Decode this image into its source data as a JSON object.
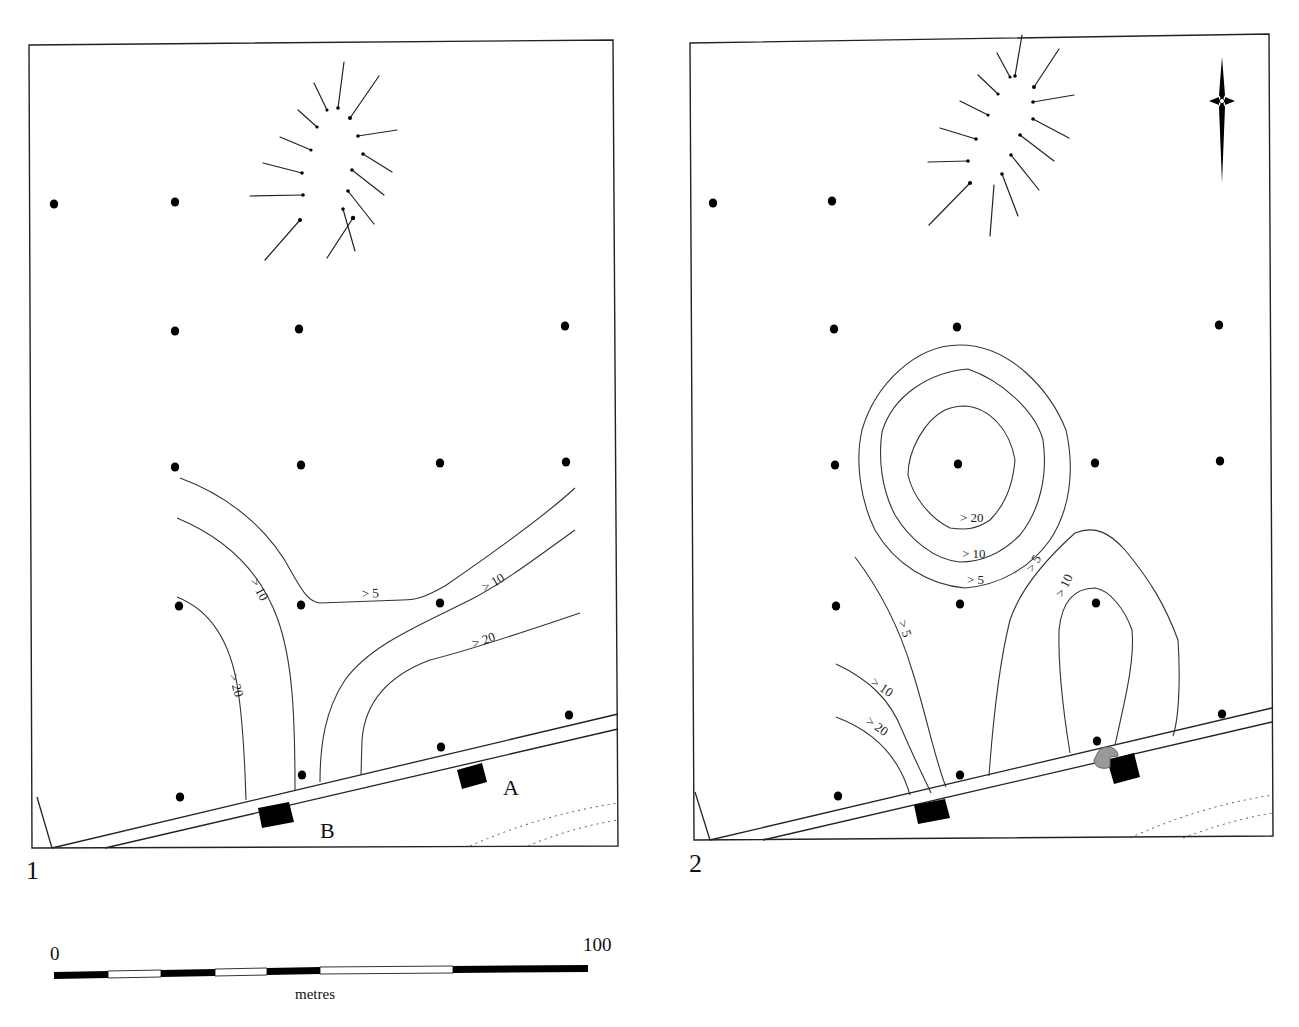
{
  "figure": {
    "panels": [
      {
        "number": "1",
        "sites": [
          {
            "label": "A",
            "x": 513,
            "y": 793
          },
          {
            "label": "B",
            "x": 331,
            "y": 835
          }
        ],
        "contour_labels": [
          {
            "text": "> 5",
            "x": 362,
            "y": 598,
            "angle": -3
          },
          {
            "text": "> 10",
            "x": 250,
            "y": 581,
            "angle": 62
          },
          {
            "text": "> 10",
            "x": 485,
            "y": 592,
            "angle": -30
          },
          {
            "text": "> 20",
            "x": 229,
            "y": 675,
            "angle": 75
          },
          {
            "text": "> 20",
            "x": 474,
            "y": 648,
            "angle": -20
          }
        ],
        "sample_points": [
          [
            54,
            204
          ],
          [
            175,
            202
          ],
          [
            175,
            331
          ],
          [
            299,
            329
          ],
          [
            565,
            326
          ],
          [
            175,
            467
          ],
          [
            301,
            465
          ],
          [
            440,
            463
          ],
          [
            566,
            462
          ],
          [
            179,
            606
          ],
          [
            301,
            605
          ],
          [
            440,
            603
          ],
          [
            569,
            715
          ],
          [
            441,
            747
          ],
          [
            302,
            775
          ],
          [
            180,
            797
          ]
        ]
      },
      {
        "number": "2",
        "sites": [],
        "contour_labels": [
          {
            "text": "> 20",
            "x": 960,
            "y": 522,
            "angle": 0
          },
          {
            "text": "> 10",
            "x": 962,
            "y": 558,
            "angle": 0
          },
          {
            "text": "> 5",
            "x": 967,
            "y": 584,
            "angle": 0
          },
          {
            "text": "> 5",
            "x": 1033,
            "y": 573,
            "angle": -60
          },
          {
            "text": "> 10",
            "x": 1063,
            "y": 598,
            "angle": -65
          },
          {
            "text": "> 5",
            "x": 898,
            "y": 622,
            "angle": 70
          },
          {
            "text": "> 10",
            "x": 870,
            "y": 684,
            "angle": 35
          },
          {
            "text": "> 20",
            "x": 865,
            "y": 723,
            "angle": 35
          }
        ],
        "sample_points": [
          [
            713,
            203
          ],
          [
            832,
            201
          ],
          [
            834,
            329
          ],
          [
            957,
            327
          ],
          [
            1219,
            325
          ],
          [
            835,
            465
          ],
          [
            958,
            464
          ],
          [
            1095,
            463
          ],
          [
            1220,
            461
          ],
          [
            836,
            606
          ],
          [
            960,
            604
          ],
          [
            1096,
            603
          ],
          [
            1222,
            714
          ],
          [
            1097,
            741
          ],
          [
            960,
            775
          ],
          [
            838,
            796
          ]
        ]
      }
    ],
    "scale_bar": {
      "start_label": "0",
      "end_label": "100",
      "unit": "metres"
    },
    "north_arrow": "north-arrow-icon"
  }
}
